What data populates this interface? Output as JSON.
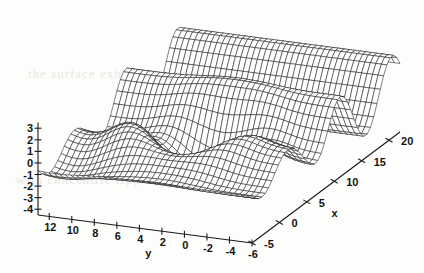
{
  "chart_data": {
    "type": "surface",
    "title": "",
    "xlabel": "x",
    "ylabel": "y",
    "zlabel": "",
    "grid": false,
    "legend": "none",
    "render_style": "wireframe-mesh",
    "projection": "3d-orthographic",
    "xlim": [
      -5,
      22
    ],
    "ylim": [
      -6,
      13
    ],
    "zlim": [
      -4.5,
      3.5
    ],
    "xticks": [
      -5,
      0,
      5,
      10,
      15,
      20
    ],
    "xticklabels": [
      "-5",
      "0",
      "5",
      "10",
      "15",
      "20"
    ],
    "yticks": [
      12,
      10,
      8,
      6,
      4,
      2,
      0,
      -2,
      -4,
      -6
    ],
    "yticklabels": [
      "12",
      "10",
      "8",
      "6",
      "4",
      "2",
      "0",
      "-2",
      "-4",
      "-6"
    ],
    "zticks": [
      3,
      2,
      1,
      0,
      -1,
      -2,
      -3,
      -4
    ],
    "zticklabels": [
      "3",
      "2",
      "1",
      "0",
      "-1",
      "-2",
      "-3",
      "-4"
    ],
    "surface_color": "#ffffff",
    "mesh_color": "#1e1e1e",
    "mesh_nx": 46,
    "mesh_ny": 40,
    "function": "ripple-crater",
    "params": {
      "crater_x": 4.0,
      "crater_y": 3.0,
      "crater_depth": -4.2,
      "ring_height": 0.9,
      "ridge_amplitude": 2.6,
      "ridge_wavelength": 9.5,
      "decay": 0.16
    }
  },
  "page": {
    "ghost_lines": [
      "the surface exhibits a central depression",
      "with concentric ripple structure"
    ]
  }
}
